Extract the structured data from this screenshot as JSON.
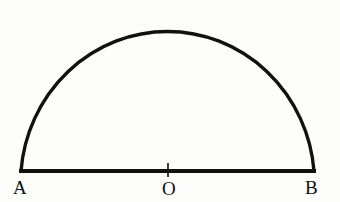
{
  "figure": {
    "kind": "geometry-diagram",
    "background_color": "#fdfdfc",
    "ink_color": "#111111",
    "width": 340,
    "height": 202,
    "labels": {
      "left_endpoint": "A",
      "centre": "O",
      "right_endpoint": "B"
    },
    "geometry": {
      "baseline": {
        "name": "diameter-AB",
        "x_start": 21,
        "x_end": 314,
        "y": 171,
        "stroke_width": 4
      },
      "arc": {
        "name": "semicircular-arc",
        "centre_x": 168,
        "centre_y": 171,
        "radius_x": 147,
        "radius_y": 152,
        "apex_y": 19,
        "stroke_width": 3.4
      },
      "centre_tick": {
        "name": "centre-tick-mark",
        "x": 168,
        "y_top": 163,
        "y_bottom": 177,
        "stroke_width": 1.6
      }
    }
  }
}
